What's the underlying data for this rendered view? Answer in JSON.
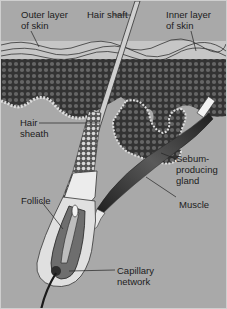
{
  "diagram": {
    "colors": {
      "background": "#a9a9a9",
      "dermis_cells": "#3a3a3a",
      "cell_dots": "#6a6a6a",
      "skin_layer": "#c9c9c9",
      "sheath": "#e6e6e6",
      "muscle": "#2e2e2e",
      "line": "#222222"
    },
    "labels": {
      "outer_layer": "Outer layer\nof skin",
      "hair_shaft": "Hair shaft",
      "inner_layer": "Inner layer\nof skin",
      "hair_sheath": "Hair\nsheath",
      "sebum_gland": "Sebum-\nproducing\ngland",
      "muscle": "Muscle",
      "follicle": "Follicle",
      "capillary": "Capillary\nnetwork"
    }
  }
}
